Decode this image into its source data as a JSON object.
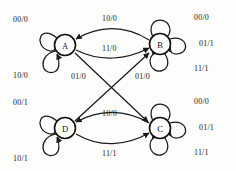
{
  "diagram": {
    "type": "state-machine",
    "notation": "input/output",
    "stroke_color": "#1a1a1a",
    "background_color": "#fdfdfc",
    "states": [
      {
        "id": "A",
        "label": "A",
        "cx": 65,
        "cy": 45
      },
      {
        "id": "B",
        "label": "B",
        "cx": 160,
        "cy": 44
      },
      {
        "id": "D",
        "label": "D",
        "cx": 65,
        "cy": 128
      },
      {
        "id": "C",
        "label": "C",
        "cx": 160,
        "cy": 128
      }
    ],
    "self_loops": [
      {
        "state": "A",
        "label": "00/0",
        "position": "upper-left"
      },
      {
        "state": "A",
        "label": "10/0",
        "position": "lower-left"
      },
      {
        "state": "B",
        "label": "00/0",
        "position": "top"
      },
      {
        "state": "B",
        "label": "01/1",
        "position": "right"
      },
      {
        "state": "B",
        "label": "11/1",
        "position": "bottom"
      },
      {
        "state": "D",
        "label": "00/1",
        "position": "upper-left"
      },
      {
        "state": "D",
        "label": "10/1",
        "position": "lower-left"
      },
      {
        "state": "C",
        "label": "00/0",
        "position": "top"
      },
      {
        "state": "C",
        "label": "01/1",
        "position": "right"
      },
      {
        "state": "C",
        "label": "11/1",
        "position": "bottom"
      }
    ],
    "transitions": [
      {
        "from": "B",
        "to": "A",
        "label": "10/0",
        "shape": "arc-upper"
      },
      {
        "from": "A",
        "to": "B",
        "label": "11/0",
        "shape": "arc-lower"
      },
      {
        "from": "A",
        "to": "C",
        "label": "01/0",
        "shape": "diagonal"
      },
      {
        "from": "D",
        "to": "B",
        "label": "01/0",
        "shape": "diagonal"
      },
      {
        "from": "C",
        "to": "D",
        "label": "10/0",
        "shape": "arc-upper"
      },
      {
        "from": "D",
        "to": "C",
        "label": "11/1",
        "shape": "arc-lower"
      }
    ],
    "labels": {
      "a_loop_top": "00/0",
      "a_loop_bottom": "10/0",
      "b_loop_top": "00/0",
      "b_loop_right": "01/1",
      "b_loop_bottom": "11/1",
      "d_loop_top": "00/1",
      "d_loop_bottom": "10/1",
      "c_loop_top": "00/0",
      "c_loop_right": "01/1",
      "c_loop_bottom": "11/1",
      "ab_top": "10/0",
      "ab_bottom": "11/0",
      "ac_diagonal": "01/0",
      "db_diagonal": "01/0",
      "dc_top": "10/0",
      "dc_bottom": "11/1"
    }
  }
}
